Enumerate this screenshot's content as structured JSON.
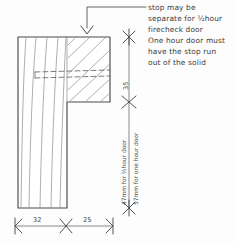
{
  "drawing": {
    "title": "Firecheck door stop joinery section detail",
    "type": "hand-drawn technical section",
    "ink_color": "#4a4a4a",
    "grain_color": "#8e8e8e",
    "paper_color": "#fdfdfd"
  },
  "annotation": {
    "name": "stop-note",
    "lines": [
      "stop may be",
      "separate for ½hour",
      "firecheck door",
      "One hour door must",
      "have the stop run",
      "out of the solid"
    ],
    "full_text": "stop may be separate for ½hour firecheck door One hour door must have the stop run out of the solid",
    "leader": "elbow leader with arrowhead pointing down to top face of stop"
  },
  "dimensions": {
    "vertical": [
      {
        "name": "stop-depth",
        "value": "35",
        "orientation": "vertical",
        "position": "upper-right"
      },
      {
        "name": "door-leaf-thickness",
        "value": "47mm for ½hour door",
        "orientation": "vertical",
        "position": "lower-right-inner"
      },
      {
        "name": "door-leaf-thickness-alt",
        "value": "57mm for one hour door",
        "orientation": "vertical",
        "position": "lower-right-outer"
      }
    ],
    "horizontal": [
      {
        "name": "frame-width",
        "value": "32",
        "position": "bottom-left"
      },
      {
        "name": "stop-width",
        "value": "25",
        "position": "bottom-right"
      }
    ]
  },
  "geometry": {
    "section_shape": "L-shaped rebated door frame section",
    "parts": [
      {
        "name": "frame-jamb",
        "description": "tall vertical member with wood grain"
      },
      {
        "name": "door-stop",
        "description": "upper right rebate block, hatched"
      }
    ],
    "hidden_line": "dashed line indicating optional separate stop joint"
  }
}
